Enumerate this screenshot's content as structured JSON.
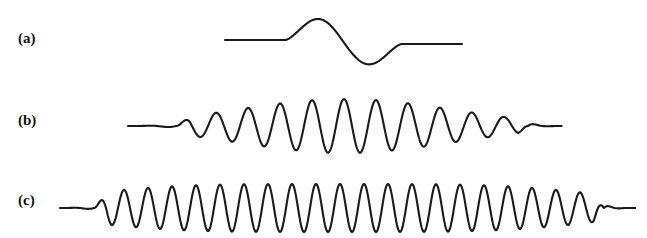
{
  "figure": {
    "width": 647,
    "height": 238,
    "background_color": "#ffffff",
    "stroke_color": "#1a1a1a",
    "stroke_width": 2.1,
    "caption_style": "bold-serif-parenthetical"
  },
  "panels": [
    {
      "id": "a",
      "label": "(a)",
      "label_x": 18,
      "label_y": 30,
      "description": "single-cycle wavelet: flat baseline, one positive lobe then one negative lobe, flat baseline",
      "baseline_y": 40,
      "x_start": 225,
      "x_end": 462,
      "cycles": 1,
      "peak": {
        "x": 313,
        "y": 13
      },
      "trough": {
        "x": 373,
        "y": 65
      },
      "envelope": "single-cycle",
      "wavelength_px": 120,
      "amplitude_px": 26,
      "lead_flat_px": 60,
      "tail_flat_px": 60
    },
    {
      "id": "b",
      "label": "(b)",
      "label_x": 18,
      "label_y": 112,
      "description": "gaussian-enveloped oscillation, moderate frequency, about eleven positive peaks",
      "baseline_y": 126,
      "x_start": 128,
      "x_end": 562,
      "cycles": 11,
      "envelope": "gaussian",
      "envelope_center_x": 345,
      "envelope_sigma_px": 108,
      "wavelength_px": 32,
      "amplitude_px": 27,
      "lead_flat_px": 48,
      "tail_flat_px": 34
    },
    {
      "id": "c",
      "label": "(c)",
      "label_x": 18,
      "label_y": 192,
      "description": "high frequency oscillation with broad flat-topped envelope, abrupt truncation at right",
      "baseline_y": 208,
      "x_start": 60,
      "x_end": 636,
      "cycles": 22,
      "envelope": "flat-top",
      "envelope_center_x": 340,
      "envelope_sigma_px": 250,
      "wavelength_px": 24,
      "amplitude_px": 24,
      "lead_flat_px": 34,
      "tail_flat_px": 32
    }
  ],
  "chart_data": {
    "type": "line",
    "title": "",
    "subtitle": "",
    "xlabel": "",
    "ylabel": "",
    "grid": false,
    "legend_position": "none",
    "axis_visible": false,
    "tick_labels": [],
    "annotations": [
      "(a)",
      "(b)",
      "(c)"
    ],
    "series": [
      {
        "name": "(a)",
        "kind": "single-cycle wavelet",
        "baseline_y": 40,
        "x_range": [
          225,
          462
        ],
        "peak_value": 26,
        "trough_value": -25,
        "n_positive_peaks": 1,
        "n_negative_troughs": 1,
        "dominant_wavelength_px": 120
      },
      {
        "name": "(b)",
        "kind": "gaussian-enveloped wave packet",
        "baseline_y": 126,
        "x_range": [
          128,
          562
        ],
        "peak_value": 27,
        "trough_value": -27,
        "n_positive_peaks": 11,
        "dominant_wavelength_px": 32
      },
      {
        "name": "(c)",
        "kind": "flat-top enveloped wave train",
        "baseline_y": 208,
        "x_range": [
          60,
          636
        ],
        "peak_value": 24,
        "trough_value": -24,
        "n_positive_peaks": 22,
        "dominant_wavelength_px": 24
      }
    ]
  }
}
